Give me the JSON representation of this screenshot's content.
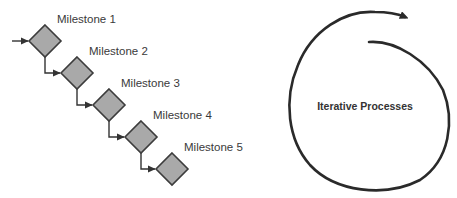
{
  "milestones": {
    "items": [
      {
        "label": "Milestone 1"
      },
      {
        "label": "Milestone 2"
      },
      {
        "label": "Milestone 3"
      },
      {
        "label": "Milestone 4"
      },
      {
        "label": "Milestone 5"
      }
    ],
    "colors": {
      "fill": "#a9a9a9",
      "stroke": "#3c3c3c",
      "connector": "#333333"
    }
  },
  "cycle": {
    "label": "Iterative Processes",
    "stroke": "#2a2a2a"
  }
}
